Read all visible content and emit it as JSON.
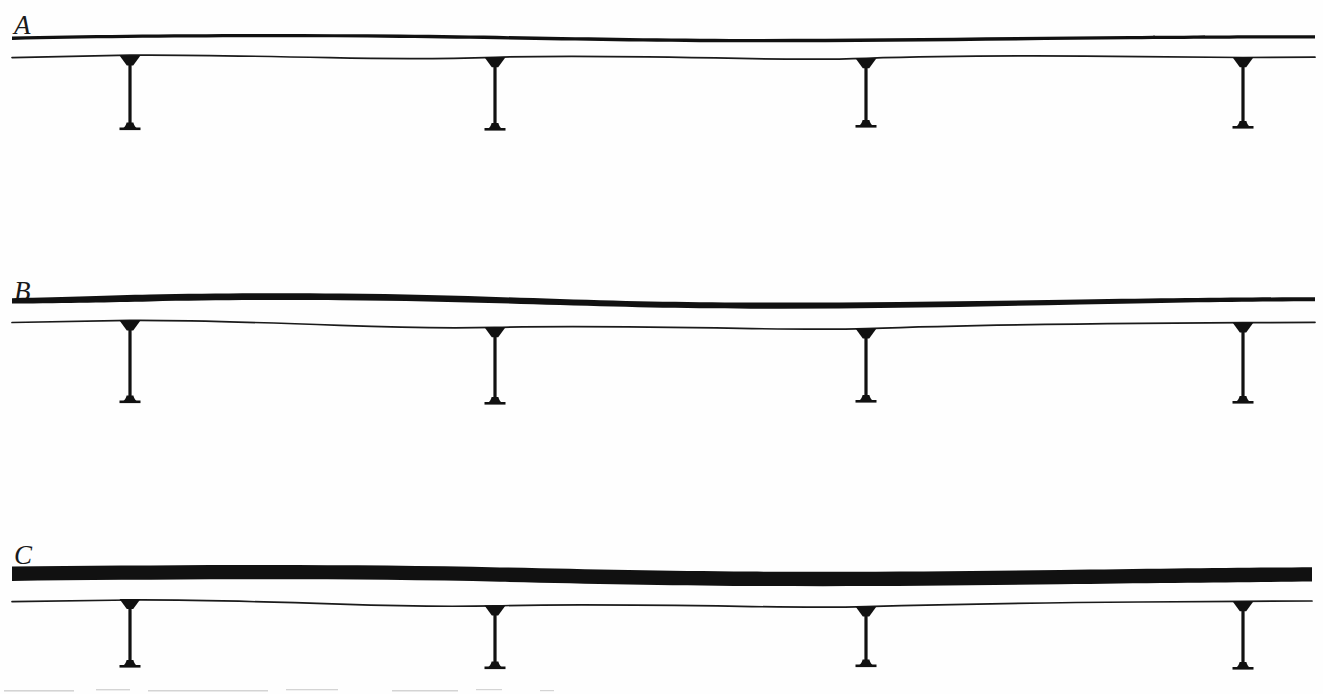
{
  "figure": {
    "caption_present": false,
    "width": 1323,
    "height": 694,
    "background_color": "#ffffff",
    "ink_color": "#111111",
    "panel_count": 3
  },
  "panels": [
    {
      "id": "panel-a",
      "label": "A",
      "label_x": 14,
      "label_y": 14,
      "band_top_y": 33,
      "band_thickness": 4,
      "lower_line_y": 56,
      "lower_line_thickness": 1.6,
      "band_left_x": 12,
      "band_right_x": 1315,
      "pendant_count": 4,
      "pendant_x": [
        130,
        495,
        866,
        1243
      ],
      "pendant_length": 72
    },
    {
      "id": "panel-b",
      "label": "B",
      "label_x": 14,
      "label_y": 282,
      "band_top_y": 298,
      "band_thickness": 9,
      "lower_line_y": 323,
      "lower_line_thickness": 1.6,
      "band_left_x": 12,
      "band_right_x": 1315,
      "pendant_count": 4,
      "pendant_x": [
        130,
        495,
        866,
        1243
      ],
      "pendant_length": 80
    },
    {
      "id": "panel-c",
      "label": "C",
      "label_x": 14,
      "label_y": 548,
      "band_top_y": 566,
      "band_thickness": 15,
      "lower_line_y": 600,
      "lower_line_thickness": 1.6,
      "band_left_x": 12,
      "band_right_x": 1312,
      "pendant_count": 4,
      "pendant_x": [
        130,
        495,
        866,
        1243
      ],
      "pendant_length": 78
    }
  ],
  "pendant": {
    "name": "suspended-pendant-element",
    "head_width": 22,
    "head_height": 9,
    "stem_width": 3.2,
    "foot_width": 20,
    "foot_height": 8
  }
}
